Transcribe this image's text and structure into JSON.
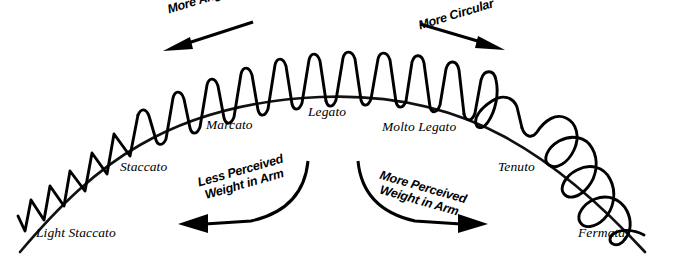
{
  "diagram": {
    "canvas": {
      "width": 679,
      "height": 260
    },
    "colors": {
      "stroke": "#000000",
      "background": "#ffffff",
      "arc": "#111111"
    },
    "arc_labels": [
      {
        "id": "light-staccato",
        "text": "Light Staccato",
        "x": 36,
        "y": 233,
        "style": "italic-serif"
      },
      {
        "id": "staccato",
        "text": "Staccato",
        "x": 120,
        "y": 167,
        "style": "italic-serif"
      },
      {
        "id": "marcato",
        "text": "Marcato",
        "x": 206,
        "y": 124,
        "style": "italic-serif"
      },
      {
        "id": "legato",
        "text": "Legato",
        "x": 308,
        "y": 111,
        "style": "italic-serif"
      },
      {
        "id": "molto-legato",
        "text": "Molto Legato",
        "x": 382,
        "y": 126,
        "style": "italic-serif"
      },
      {
        "id": "tenuto",
        "text": "Tenuto",
        "x": 498,
        "y": 166,
        "style": "italic-serif"
      },
      {
        "id": "fermata",
        "text": "Fermata",
        "x": 578,
        "y": 233,
        "style": "italic-serif"
      }
    ],
    "top_annotations": [
      {
        "id": "more-angular",
        "text": "More Angular",
        "direction": "left",
        "x": 166,
        "y": 6
      },
      {
        "id": "more-circular",
        "text": "More Circular",
        "direction": "right",
        "x": 417,
        "y": 6
      }
    ],
    "bottom_annotations": [
      {
        "id": "less-perceived-weight",
        "line1": "Less Perceived",
        "line2": "Weight in Arm",
        "direction": "left",
        "x": 196,
        "y": 172
      },
      {
        "id": "more-perceived-weight",
        "line1": "More Perceived",
        "line2": "Weight in Arm",
        "direction": "right",
        "x": 382,
        "y": 172
      }
    ],
    "icons": {
      "left_top_arrow": "arrow-left-icon",
      "right_top_arrow": "arrow-right-icon",
      "left_curved_arrow": "curved-arrow-left-icon",
      "right_curved_arrow": "curved-arrow-right-icon",
      "wave": "articulation-wave-icon",
      "arch": "arch-baseline-icon"
    }
  }
}
